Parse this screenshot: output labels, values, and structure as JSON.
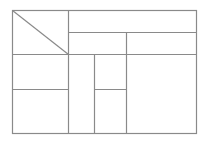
{
  "diagram": {
    "title": "",
    "type": "table-layout-skeleton",
    "canvas": {
      "width": 215,
      "height": 146
    },
    "stroke_color": "#8a8a8a",
    "background_color": "#ffffff",
    "stroke_width": 1.2,
    "outer_frame": {
      "x1": 12.5,
      "y1": 10.5,
      "x2": 196.5,
      "y2": 133.5
    },
    "lines": [
      {
        "name": "header-divider-vertical",
        "x1": 68.5,
        "y1": 10.5,
        "x2": 68.5,
        "y2": 133.5
      },
      {
        "name": "header-row-1-divider",
        "x1": 68.5,
        "y1": 32.5,
        "x2": 196.5,
        "y2": 32.5
      },
      {
        "name": "header-bottom-divider",
        "x1": 12.5,
        "y1": 54.5,
        "x2": 196.5,
        "y2": 54.5
      },
      {
        "name": "header-row-2-split",
        "x1": 126.5,
        "y1": 32.5,
        "x2": 126.5,
        "y2": 133.5
      },
      {
        "name": "body-column-split",
        "x1": 94.5,
        "y1": 54.5,
        "x2": 94.5,
        "y2": 133.5
      },
      {
        "name": "left-body-row-divider",
        "x1": 12.5,
        "y1": 89.5,
        "x2": 68.5,
        "y2": 89.5
      },
      {
        "name": "middle-body-row-divider",
        "x1": 94.5,
        "y1": 89.5,
        "x2": 126.5,
        "y2": 89.5
      },
      {
        "name": "corner-diagonal",
        "x1": 12.5,
        "y1": 10.5,
        "x2": 68.5,
        "y2": 54.5
      }
    ]
  }
}
